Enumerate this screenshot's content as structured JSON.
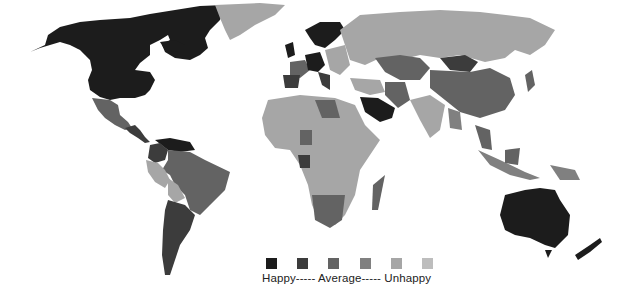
{
  "map": {
    "title": "World happiness map",
    "colors": {
      "level1": "#1c1c1c",
      "level2": "#3c3c3c",
      "level3": "#636363",
      "level4": "#808080",
      "level5": "#a6a6a6",
      "level6": "#bdbdbd",
      "background": "#ffffff"
    },
    "regions": [
      {
        "name": "North America (USA/Canada)",
        "level": 1
      },
      {
        "name": "Greenland",
        "level": 5
      },
      {
        "name": "Mexico",
        "level": 3
      },
      {
        "name": "Central America",
        "level": 2
      },
      {
        "name": "Venezuela",
        "level": 1
      },
      {
        "name": "Colombia",
        "level": 2
      },
      {
        "name": "Brazil",
        "level": 3
      },
      {
        "name": "Peru",
        "level": 5
      },
      {
        "name": "Bolivia",
        "level": 5
      },
      {
        "name": "Argentina",
        "level": 2
      },
      {
        "name": "Chile",
        "level": 2
      },
      {
        "name": "Scandinavia",
        "level": 1
      },
      {
        "name": "UK & Ireland",
        "level": 1
      },
      {
        "name": "Western Europe",
        "level": 2
      },
      {
        "name": "Spain",
        "level": 2
      },
      {
        "name": "Eastern Europe",
        "level": 5
      },
      {
        "name": "Russia",
        "level": 5
      },
      {
        "name": "Kazakhstan",
        "level": 3
      },
      {
        "name": "Mongolia",
        "level": 2
      },
      {
        "name": "China",
        "level": 3
      },
      {
        "name": "India",
        "level": 5
      },
      {
        "name": "Saudi Arabia",
        "level": 1
      },
      {
        "name": "Iran",
        "level": 3
      },
      {
        "name": "North Africa",
        "level": 5
      },
      {
        "name": "Libya",
        "level": 3
      },
      {
        "name": "Sub-Saharan Africa",
        "level": 5
      },
      {
        "name": "Southern Africa",
        "level": 3
      },
      {
        "name": "Madagascar",
        "level": 3
      },
      {
        "name": "Indonesia",
        "level": 4
      },
      {
        "name": "Japan",
        "level": 3
      },
      {
        "name": "Australia",
        "level": 1
      },
      {
        "name": "New Zealand",
        "level": 1
      }
    ]
  },
  "legend": {
    "label": "Happy----- Average----- Unhappy",
    "items": [
      {
        "level": 1,
        "color": "#1c1c1c"
      },
      {
        "level": 2,
        "color": "#3c3c3c"
      },
      {
        "level": 3,
        "color": "#636363"
      },
      {
        "level": 4,
        "color": "#808080"
      },
      {
        "level": 5,
        "color": "#a6a6a6"
      },
      {
        "level": 6,
        "color": "#bdbdbd"
      }
    ]
  }
}
